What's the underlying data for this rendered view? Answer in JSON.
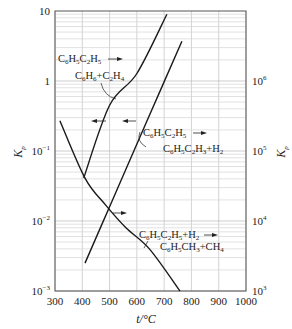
{
  "chart_data": {
    "type": "line",
    "title": "",
    "xlabel": "t/°C",
    "ylabel": "Kp",
    "ylabel_right": "Kp",
    "xlim": [
      300,
      1000
    ],
    "ylim": [
      0.001,
      10
    ],
    "ylim_right": [
      1000,
      10000000
    ],
    "yscale": "log",
    "grid": true,
    "x_ticks": [
      "300",
      "400",
      "500",
      "600",
      "700",
      "800",
      "900",
      "1000"
    ],
    "y_ticks_left": [
      {
        "value": 10,
        "base": "10",
        "exp": ""
      },
      {
        "value": 1,
        "base": "1",
        "exp": ""
      },
      {
        "value": 0.1,
        "base": "10",
        "exp": "−1"
      },
      {
        "value": 0.01,
        "base": "10",
        "exp": "−2"
      },
      {
        "value": 0.001,
        "base": "10",
        "exp": "−3"
      }
    ],
    "y_ticks_right": [
      {
        "value": 1000000,
        "base": "10",
        "exp": "6"
      },
      {
        "value": 100000,
        "base": "10",
        "exp": "5"
      },
      {
        "value": 10000,
        "base": "10",
        "exp": "4"
      },
      {
        "value": 1000,
        "base": "10",
        "exp": "3"
      }
    ],
    "series": [
      {
        "name": "C6H5C2H5 → C6H6 + C2H4",
        "axis": "left",
        "x": [
          405,
          500,
          600,
          710
        ],
        "values": [
          0.041,
          0.45,
          1.28,
          9.0
        ]
      },
      {
        "name": "C6H5C2H5 → C6H5C2H3 + H2",
        "axis": "left",
        "x": [
          410,
          500,
          600,
          700,
          765
        ],
        "values": [
          0.0025,
          0.016,
          0.126,
          0.97,
          3.7
        ]
      },
      {
        "name": "C6H5C2H5 + H2 → C6H5CH3 + CH4",
        "axis": "right",
        "x": [
          318,
          410,
          485,
          560,
          648,
          758
        ],
        "values": [
          270000,
          41000,
          17000,
          8000,
          3900,
          1000
        ]
      }
    ],
    "annotations": [
      {
        "reactant": [
          "C",
          "6",
          "H",
          "5",
          "C",
          "2",
          "H",
          "5"
        ],
        "product": [
          "C",
          "6",
          "H",
          "6",
          "+C",
          "2",
          "H",
          "4"
        ]
      },
      {
        "reactant": [
          "C",
          "6",
          "H",
          "5",
          "C",
          "2",
          "H",
          "5"
        ],
        "product": [
          "C",
          "6",
          "H",
          "5",
          "C",
          "2",
          "H",
          "3",
          "+H",
          "2",
          ""
        ]
      },
      {
        "reactant": [
          "C",
          "6",
          "H",
          "5",
          "C",
          "2",
          "H",
          "5",
          "+H",
          "2"
        ],
        "product": [
          "C",
          "6",
          "H",
          "5",
          "CH",
          "3",
          "+CH",
          "4"
        ]
      }
    ]
  }
}
